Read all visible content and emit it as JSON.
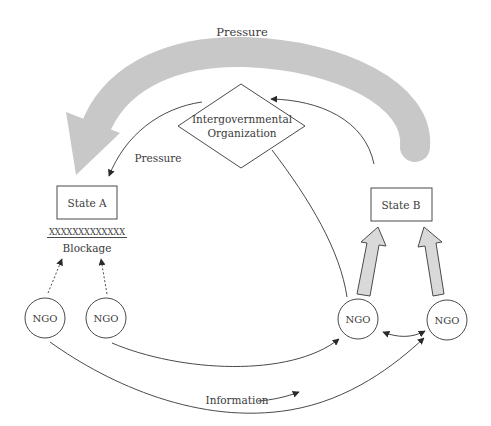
{
  "diagram": {
    "colors": {
      "stroke": "#4a4a4a",
      "pressure_arrow_fill": "#c8c8c8",
      "block_arrow_fill": "#d9d9d9",
      "text": "#3a3a3a"
    },
    "labels": {
      "top_pressure": "Pressure",
      "igo_line1": "Intergovernmental",
      "igo_line2": "Organization",
      "igo_pressure": "Pressure",
      "state_a": "State A",
      "state_b": "State B",
      "blockage_marks": "XXXXXXXXXXXXX",
      "blockage": "Blockage",
      "information": "Information"
    },
    "ngos": [
      {
        "label": "NGO"
      },
      {
        "label": "NGO"
      },
      {
        "label": "NGO"
      },
      {
        "label": "NGO"
      }
    ]
  }
}
